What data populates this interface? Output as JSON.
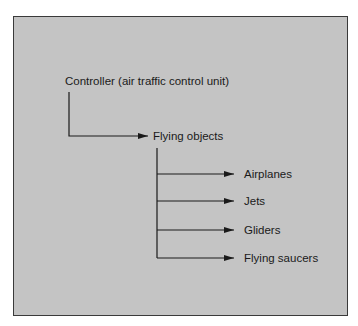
{
  "diagram": {
    "root": {
      "label": "Controller (air traffic control unit)"
    },
    "child": {
      "label": "Flying objects"
    },
    "leaves": [
      {
        "label": "Airplanes"
      },
      {
        "label": "Jets"
      },
      {
        "label": "Gliders"
      },
      {
        "label": "Flying saucers"
      }
    ],
    "colors": {
      "panel": "#c4c4c4",
      "border": "#3a3a3a",
      "line": "#1a1a1a"
    }
  }
}
